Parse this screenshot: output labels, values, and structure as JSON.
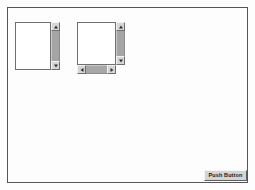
{
  "window": {
    "background_color": "#fdfdfe",
    "border_color": "#54565a"
  },
  "panels": [
    {
      "name": "scrolled-window-vertical",
      "has_vertical_scrollbar": true,
      "has_horizontal_scrollbar": false,
      "scrollbar_track_color": "#a5a5a5",
      "content": "",
      "buttons": {
        "scroll_up": "scroll-up-arrow",
        "scroll_down": "scroll-down-arrow"
      }
    },
    {
      "name": "scrolled-window-both",
      "has_vertical_scrollbar": true,
      "has_horizontal_scrollbar": true,
      "scrollbar_track_color": "#a5a5a5",
      "content": "",
      "buttons": {
        "scroll_up": "scroll-up-arrow",
        "scroll_down": "scroll-down-arrow",
        "scroll_left": "scroll-left-arrow",
        "scroll_right": "scroll-right-arrow"
      }
    }
  ],
  "footer": {
    "push_button_label": "Push Button"
  }
}
